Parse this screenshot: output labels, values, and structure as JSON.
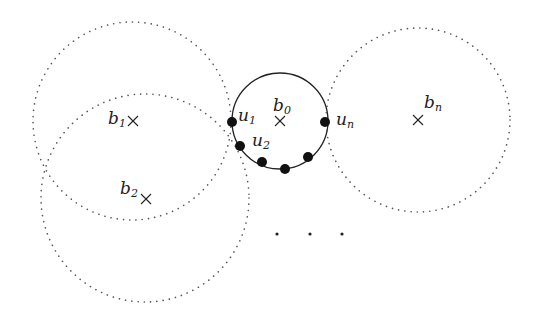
{
  "diagram": {
    "colors": {
      "stroke": "#222222",
      "dotted": "#555555",
      "node_fill": "#111111",
      "background": "#ffffff"
    },
    "circles": [
      {
        "id": "b1",
        "cx": 132,
        "cy": 121,
        "r": 99,
        "style": "dotted"
      },
      {
        "id": "b2",
        "cx": 145,
        "cy": 198,
        "r": 104,
        "style": "dotted"
      },
      {
        "id": "b0",
        "cx": 280,
        "cy": 121,
        "r": 48,
        "style": "solid"
      },
      {
        "id": "bn",
        "cx": 418,
        "cy": 120,
        "r": 92,
        "style": "dotted"
      }
    ],
    "centers": [
      {
        "id": "b1",
        "x": 133,
        "y": 121,
        "label": "b",
        "sub": "1",
        "label_x": 108,
        "label_y": 124
      },
      {
        "id": "b2",
        "x": 146,
        "y": 199,
        "label": "b",
        "sub": "2",
        "label_x": 120,
        "label_y": 194
      },
      {
        "id": "b0",
        "x": 280,
        "y": 121,
        "label": "b",
        "sub": "0",
        "label_x": 273,
        "label_y": 111
      },
      {
        "id": "bn",
        "x": 418,
        "y": 120,
        "label": "b",
        "sub": "n",
        "label_x": 425,
        "label_y": 108
      }
    ],
    "nodes": [
      {
        "id": "u1",
        "x": 232,
        "y": 122,
        "label": "u",
        "sub": "1",
        "label_x": 238,
        "label_y": 120
      },
      {
        "id": "u2",
        "x": 240,
        "y": 146,
        "label": "u",
        "sub": "2",
        "label_x": 252,
        "label_y": 145
      },
      {
        "id": "u3",
        "x": 262,
        "y": 162
      },
      {
        "id": "u4",
        "x": 285,
        "y": 169
      },
      {
        "id": "u5",
        "x": 308,
        "y": 157
      },
      {
        "id": "un",
        "x": 325,
        "y": 122,
        "label": "u",
        "sub": "n",
        "label_x": 337,
        "label_y": 126
      }
    ],
    "ellipsis": {
      "text": ". . .",
      "points": [
        [
          277,
          234
        ],
        [
          310,
          234
        ],
        [
          342,
          234
        ]
      ]
    },
    "labels": {
      "b1": "b",
      "b1_sub": "1",
      "b2": "b",
      "b2_sub": "2",
      "b0": "b",
      "b0_sub": "0",
      "bn": "b",
      "bn_sub": "n",
      "u1": "u",
      "u1_sub": "1",
      "u2": "u",
      "u2_sub": "2",
      "un": "u",
      "un_sub": "n"
    }
  }
}
